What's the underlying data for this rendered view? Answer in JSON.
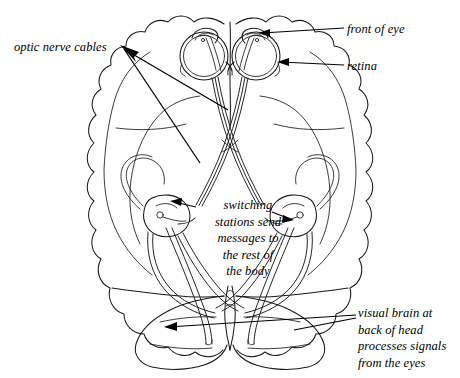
{
  "figure": {
    "background_color": "#ffffff",
    "ink_color": "#1a1a1a",
    "width": 460,
    "height": 378,
    "style": "black-and-white line drawing / pen-and-ink illustration"
  },
  "labels": {
    "optic_nerve_cables": "optic nerve cables",
    "front_of_eye": "front of eye",
    "retina": "retina",
    "switching_stations": "switching\nstations send\nmessages to\nthe rest of\nthe body",
    "visual_brain": "visual brain at\nback of head\nprocesses signals\nfrom the eyes"
  },
  "structures": [
    {
      "name": "left-eyeball",
      "description": "eyeball with lens and cornea, upper left of figure"
    },
    {
      "name": "right-eyeball",
      "description": "eyeball with lens and cornea, upper right of figure"
    },
    {
      "name": "left-optic-nerve",
      "description": "cable running back from left eye, crossing to right side"
    },
    {
      "name": "right-optic-nerve",
      "description": "cable running back from right eye, crossing to left side"
    },
    {
      "name": "optic-chiasm",
      "description": "X-shaped crossing point of the two optic nerves"
    },
    {
      "name": "left-switching-station",
      "description": "lateral geniculate relay body, left hemisphere"
    },
    {
      "name": "right-switching-station",
      "description": "lateral geniculate relay body, right hemisphere"
    },
    {
      "name": "left-optic-radiation",
      "description": "fibre bundle from left relay to occipital lobe"
    },
    {
      "name": "right-optic-radiation",
      "description": "fibre bundle from right relay to occipital lobe"
    },
    {
      "name": "cerebral-hemispheres",
      "description": "large lobed outline of the brain"
    },
    {
      "name": "occipital-lobes",
      "description": "visual brain at the back of the head, bottom of figure"
    },
    {
      "name": "brainstem-vermis",
      "description": "narrow midline structure between occipital lobes"
    }
  ]
}
